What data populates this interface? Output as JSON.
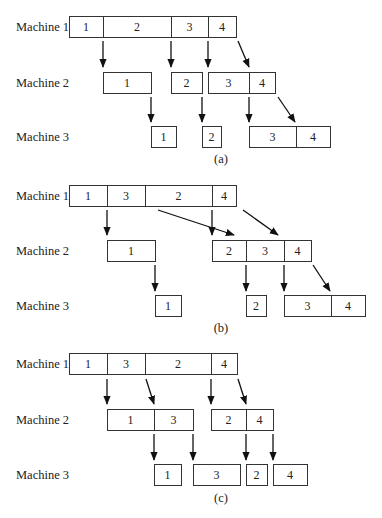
{
  "machine_labels": [
    "Machine 1",
    "Machine 2",
    "Machine 3"
  ],
  "panels": [
    {
      "caption": "(a)",
      "job_order": [
        "1",
        "2",
        "3",
        "4"
      ],
      "rows": [
        [
          {
            "jobs": [
              "1",
              "2",
              "3",
              "4"
            ]
          }
        ],
        [
          {
            "jobs": [
              "1"
            ]
          },
          {
            "jobs": [
              "2"
            ]
          },
          {
            "jobs": [
              "3",
              "4"
            ]
          }
        ],
        [
          {
            "jobs": [
              "1"
            ]
          },
          {
            "jobs": [
              "2"
            ]
          },
          {
            "jobs": [
              "3",
              "4"
            ]
          }
        ]
      ]
    },
    {
      "caption": "(b)",
      "job_order": [
        "1",
        "3",
        "2",
        "4"
      ],
      "rows": [
        [
          {
            "jobs": [
              "1",
              "3",
              "2",
              "4"
            ]
          }
        ],
        [
          {
            "jobs": [
              "1"
            ]
          },
          {
            "jobs": [
              "2",
              "3",
              "4"
            ]
          }
        ],
        [
          {
            "jobs": [
              "1"
            ]
          },
          {
            "jobs": [
              "2"
            ]
          },
          {
            "jobs": [
              "3",
              "4"
            ]
          }
        ]
      ]
    },
    {
      "caption": "(c)",
      "job_order": [
        "1",
        "3",
        "2",
        "4"
      ],
      "rows": [
        [
          {
            "jobs": [
              "1",
              "3",
              "2",
              "4"
            ]
          }
        ],
        [
          {
            "jobs": [
              "1",
              "3"
            ]
          },
          {
            "jobs": [
              "2",
              "4"
            ]
          }
        ],
        [
          {
            "jobs": [
              "1"
            ]
          },
          {
            "jobs": [
              "3"
            ]
          },
          {
            "jobs": [
              "2"
            ]
          },
          {
            "jobs": [
              "4"
            ]
          }
        ]
      ]
    }
  ]
}
